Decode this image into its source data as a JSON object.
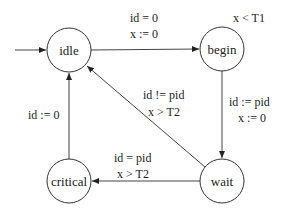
{
  "diagram": {
    "type": "state-machine",
    "states": [
      {
        "id": "idle",
        "label": "idle",
        "cx": 69,
        "cy": 50,
        "initial": true
      },
      {
        "id": "begin",
        "label": "begin",
        "cx": 222,
        "cy": 49,
        "invariant": "x < T1"
      },
      {
        "id": "wait",
        "label": "wait",
        "cx": 222,
        "cy": 181
      },
      {
        "id": "critical",
        "label": "critical",
        "cx": 69,
        "cy": 181
      }
    ],
    "transitions": [
      {
        "from": "idle",
        "to": "begin",
        "guard": "id = 0",
        "update": "x := 0"
      },
      {
        "from": "begin",
        "to": "wait",
        "guard": "id := pid",
        "update": "x := 0"
      },
      {
        "from": "wait",
        "to": "idle",
        "guard": "id != pid",
        "update": "x > T2"
      },
      {
        "from": "wait",
        "to": "critical",
        "guard": "id = pid",
        "update": "x > T2"
      },
      {
        "from": "critical",
        "to": "idle",
        "guard": "id := 0",
        "update": ""
      }
    ],
    "labels": {
      "idle_begin_1": "id = 0",
      "idle_begin_2": "x := 0",
      "begin_invariant": "x < T1",
      "begin_wait_1": "id := pid",
      "begin_wait_2": "x := 0",
      "wait_idle_1": "id != pid",
      "wait_idle_2": "x > T2",
      "wait_critical_1": "id = pid",
      "wait_critical_2": "x > T2",
      "critical_idle_1": "id := 0"
    },
    "colors": {
      "stroke": "#333333",
      "background": "#ffffff",
      "text": "#222222"
    }
  }
}
